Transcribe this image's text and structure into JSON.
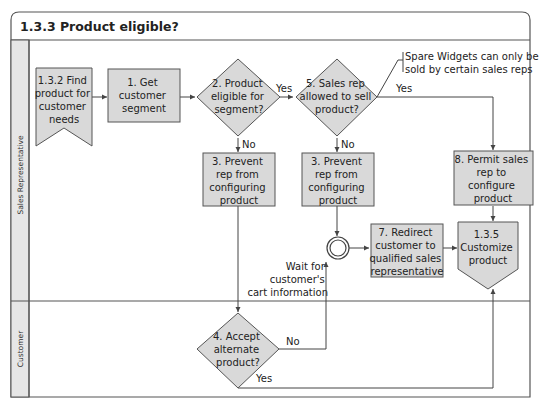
{
  "diagram": {
    "title": "1.3.3 Product eligible?",
    "lanes": [
      {
        "label": "Sales Representative"
      },
      {
        "label": "Customer"
      }
    ],
    "nodes": {
      "find_product": {
        "line1": "1.3.2 Find",
        "line2": "product for",
        "line3": "customer",
        "line4": "needs"
      },
      "get_segment": {
        "line1": "1. Get",
        "line2": "customer",
        "line3": "segment"
      },
      "eligible": {
        "line1": "2. Product",
        "line2": "eligible for",
        "line3": "segment?"
      },
      "allowed": {
        "line1": "5. Sales rep",
        "line2": "allowed to sell",
        "line3": "product?"
      },
      "prevent_a": {
        "line1": "3. Prevent",
        "line2": "rep from",
        "line3": "configuring",
        "line4": "product"
      },
      "prevent_b": {
        "line1": "3. Prevent",
        "line2": "rep from",
        "line3": "configuring",
        "line4": "product"
      },
      "permit": {
        "line1": "8. Permit sales",
        "line2": "rep to",
        "line3": "configure",
        "line4": "product"
      },
      "redirect": {
        "line1": "7. Redirect",
        "line2": "customer to",
        "line3": "qualified sales",
        "line4": "representative"
      },
      "customize": {
        "line1": "1.3.5",
        "line2": "Customize",
        "line3": "product"
      },
      "accept": {
        "line1": "4. Accept",
        "line2": "alternate",
        "line3": "product?"
      }
    },
    "event_label": {
      "line1": "Wait for",
      "line2": "customer's",
      "line3": "cart information"
    },
    "annotation": {
      "line1": "Spare Widgets can only be",
      "line2": "sold by certain sales reps"
    },
    "edge_labels": {
      "eligible_yes": "Yes",
      "eligible_no": "No",
      "allowed_yes": "Yes",
      "allowed_no": "No",
      "accept_no": "No",
      "accept_yes": "Yes"
    },
    "colors": {
      "shape_fill": "#d9d9d9",
      "stroke": "#555555",
      "lane_fill": "#e6e6e6"
    }
  }
}
